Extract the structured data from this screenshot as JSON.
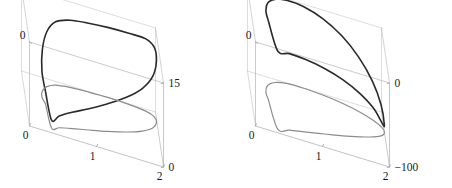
{
  "figure": {
    "type": "two-panel-3d-parametric-plot",
    "background_color": "#ffffff",
    "box_line_color": "#b4b4b4",
    "curve_color": "#2a2a2a",
    "projection_color": "#8c8c8c",
    "tick_label_color": "#1a1a1a"
  },
  "chart_data": [
    {
      "type": "line",
      "title": "",
      "subtitle": "",
      "panel": "left",
      "projection": "3d-box-wireframe",
      "xlabel": "",
      "ylabel": "",
      "zlabel": "",
      "grid": false,
      "legend": null,
      "axes": {
        "x": {
          "ticks": [
            0,
            1,
            2
          ],
          "tick_labels": [
            "0",
            "1",
            "2"
          ],
          "range": [
            0,
            2
          ],
          "position": "bottom-front"
        },
        "y": {
          "ticks": [
            0,
            1
          ],
          "tick_labels": [
            "0",
            "1"
          ],
          "range": [
            0,
            1
          ],
          "position": "top-left-depth"
        },
        "z": {
          "ticks": [
            0,
            15
          ],
          "tick_labels": [
            "0",
            "15"
          ],
          "range": [
            0,
            15
          ],
          "position": "right-vertical"
        }
      },
      "series": [
        {
          "name": "solution-curve",
          "style": "solid",
          "color": "#2a2a2a",
          "width": 1.6,
          "closed": true,
          "description": "dark closed leaf/teardrop shaped loop rising to the right, peaking near z=15",
          "points": [
            [
              0.3,
              0.52,
              2.2
            ],
            [
              0.26,
              0.62,
              4.6
            ],
            [
              0.28,
              0.74,
              7.4
            ],
            [
              0.36,
              0.85,
              9.8
            ],
            [
              0.5,
              0.93,
              11.3
            ],
            [
              0.72,
              0.97,
              12.0
            ],
            [
              1.0,
              0.99,
              12.3
            ],
            [
              1.3,
              1.0,
              12.5
            ],
            [
              1.6,
              0.99,
              12.7
            ],
            [
              1.85,
              0.96,
              12.9
            ],
            [
              1.97,
              0.9,
              12.4
            ],
            [
              1.99,
              0.8,
              11.0
            ],
            [
              1.92,
              0.68,
              9.2
            ],
            [
              1.75,
              0.56,
              7.6
            ],
            [
              1.5,
              0.45,
              6.2
            ],
            [
              1.2,
              0.35,
              4.9
            ],
            [
              0.92,
              0.27,
              3.8
            ],
            [
              0.66,
              0.2,
              2.9
            ],
            [
              0.46,
              0.14,
              2.1
            ],
            [
              0.34,
              0.09,
              1.4
            ],
            [
              0.3,
              0.52,
              2.2
            ]
          ]
        },
        {
          "name": "floor-projection",
          "style": "solid",
          "color": "#8c8c8c",
          "width": 1.2,
          "closed": true,
          "description": "gray projection of the loop onto the z=0 base plane",
          "points": [
            [
              0.3,
              0.52,
              0
            ],
            [
              0.26,
              0.62,
              0
            ],
            [
              0.28,
              0.74,
              0
            ],
            [
              0.36,
              0.85,
              0
            ],
            [
              0.5,
              0.93,
              0
            ],
            [
              0.72,
              0.97,
              0
            ],
            [
              1.0,
              0.99,
              0
            ],
            [
              1.3,
              1.0,
              0
            ],
            [
              1.6,
              0.99,
              0
            ],
            [
              1.85,
              0.96,
              0
            ],
            [
              1.97,
              0.9,
              0
            ],
            [
              1.99,
              0.8,
              0
            ],
            [
              1.92,
              0.68,
              0
            ],
            [
              1.75,
              0.56,
              0
            ],
            [
              1.5,
              0.45,
              0
            ],
            [
              1.2,
              0.35,
              0
            ],
            [
              0.92,
              0.27,
              0
            ],
            [
              0.66,
              0.2,
              0
            ],
            [
              0.46,
              0.14,
              0
            ],
            [
              0.34,
              0.09,
              0
            ],
            [
              0.3,
              0.52,
              0
            ]
          ]
        }
      ]
    },
    {
      "type": "line",
      "title": "",
      "subtitle": "",
      "panel": "right",
      "projection": "3d-box-wireframe",
      "xlabel": "",
      "ylabel": "",
      "zlabel": "",
      "grid": false,
      "legend": null,
      "axes": {
        "x": {
          "ticks": [
            0,
            1,
            2
          ],
          "tick_labels": [
            "0",
            "1",
            "2"
          ],
          "range": [
            0,
            2
          ],
          "position": "bottom-front"
        },
        "y": {
          "ticks": [
            0,
            1
          ],
          "tick_labels": [
            "0",
            "1"
          ],
          "range": [
            0,
            1
          ],
          "position": "top-left-depth"
        },
        "z": {
          "ticks": [
            0,
            -100
          ],
          "tick_labels": [
            "0",
            "−100"
          ],
          "range": [
            -100,
            0
          ],
          "position": "right-vertical"
        }
      },
      "series": [
        {
          "name": "solution-curve",
          "style": "solid",
          "color": "#2a2a2a",
          "width": 1.6,
          "closed": true,
          "description": "dark narrow elongated loop descending steeply to the right toward z=-100",
          "points": [
            [
              0.26,
              0.58,
              -6
            ],
            [
              0.24,
              0.7,
              -4
            ],
            [
              0.28,
              0.84,
              -2
            ],
            [
              0.4,
              0.94,
              -1
            ],
            [
              0.58,
              0.99,
              -1
            ],
            [
              0.84,
              1.0,
              -3
            ],
            [
              1.12,
              0.98,
              -9
            ],
            [
              1.4,
              0.94,
              -20
            ],
            [
              1.64,
              0.88,
              -35
            ],
            [
              1.84,
              0.8,
              -54
            ],
            [
              1.96,
              0.72,
              -74
            ],
            [
              2.0,
              0.64,
              -92
            ],
            [
              1.96,
              0.56,
              -86
            ],
            [
              1.82,
              0.48,
              -66
            ],
            [
              1.6,
              0.4,
              -48
            ],
            [
              1.34,
              0.32,
              -33
            ],
            [
              1.06,
              0.25,
              -22
            ],
            [
              0.78,
              0.18,
              -14
            ],
            [
              0.52,
              0.12,
              -9
            ],
            [
              0.34,
              0.07,
              -7
            ],
            [
              0.26,
              0.58,
              -6
            ]
          ]
        },
        {
          "name": "floor-projection",
          "style": "solid",
          "color": "#8c8c8c",
          "width": 1.2,
          "closed": true,
          "description": "gray projection of the loop onto the base plane",
          "points": [
            [
              0.26,
              0.58,
              -100
            ],
            [
              0.24,
              0.7,
              -100
            ],
            [
              0.28,
              0.84,
              -100
            ],
            [
              0.4,
              0.94,
              -100
            ],
            [
              0.58,
              0.99,
              -100
            ],
            [
              0.84,
              1.0,
              -100
            ],
            [
              1.12,
              0.98,
              -100
            ],
            [
              1.4,
              0.94,
              -100
            ],
            [
              1.64,
              0.88,
              -100
            ],
            [
              1.84,
              0.8,
              -100
            ],
            [
              1.96,
              0.72,
              -100
            ],
            [
              2.0,
              0.64,
              -100
            ],
            [
              1.96,
              0.56,
              -100
            ],
            [
              1.82,
              0.48,
              -100
            ],
            [
              1.6,
              0.4,
              -100
            ],
            [
              1.34,
              0.32,
              -100
            ],
            [
              1.06,
              0.25,
              -100
            ],
            [
              0.78,
              0.18,
              -100
            ],
            [
              0.52,
              0.12,
              -100
            ],
            [
              0.34,
              0.07,
              -100
            ],
            [
              0.26,
              0.58,
              -100
            ]
          ]
        }
      ]
    }
  ],
  "panels": {
    "left": {
      "name": "left-plot",
      "y_axis_labels": [
        "0",
        "1"
      ],
      "z_axis_labels": [
        "15",
        "0"
      ],
      "x_axis_labels": [
        "0",
        "1",
        "2"
      ]
    },
    "right": {
      "name": "right-plot",
      "y_axis_labels": [
        "0",
        "1"
      ],
      "z_axis_labels": [
        "0",
        "−100"
      ],
      "x_axis_labels": [
        "0",
        "1",
        "2"
      ]
    }
  }
}
